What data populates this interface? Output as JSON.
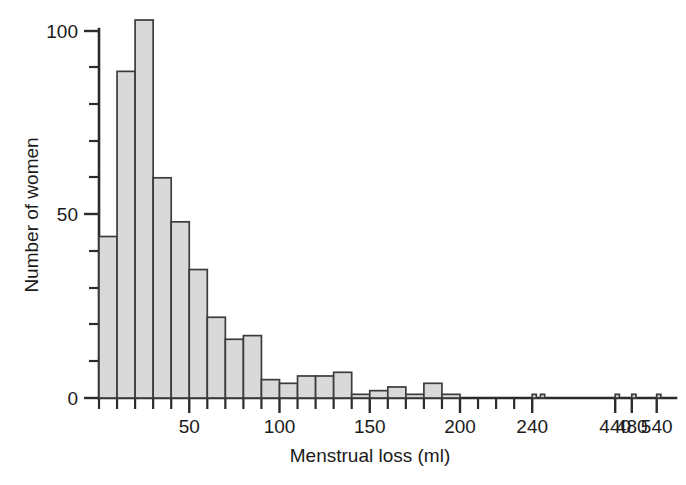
{
  "chart_data": {
    "type": "bar",
    "title": "",
    "subtitle": "",
    "xlabel": "Menstrual loss (ml)",
    "ylabel": "Number of women",
    "xlim": [
      0,
      570
    ],
    "ylim": [
      0,
      105
    ],
    "grid": false,
    "legend": null,
    "bin_width": 10,
    "axis_break_note": "x-axis compressed after 240",
    "y_ticks_major": [
      0,
      50,
      100
    ],
    "y_ticks_major_labels": [
      "0",
      "50",
      "100"
    ],
    "y_tick_minor_step": 10,
    "x_ticks_labeled": [
      50,
      100,
      150,
      200,
      240,
      440,
      480,
      540
    ],
    "x_tick_labels": [
      "50",
      "100",
      "150",
      "200",
      "240",
      "440",
      "480",
      "540"
    ],
    "x_tick_minor_step": 10,
    "bin_starts": [
      0,
      10,
      20,
      30,
      40,
      50,
      60,
      70,
      80,
      90,
      100,
      110,
      120,
      130,
      140,
      150,
      160,
      170,
      180,
      190,
      240,
      260,
      440,
      480,
      540
    ],
    "categories": [
      "0-10",
      "10-20",
      "20-30",
      "30-40",
      "40-50",
      "50-60",
      "60-70",
      "70-80",
      "80-90",
      "90-100",
      "100-110",
      "110-120",
      "120-130",
      "130-140",
      "140-150",
      "150-160",
      "160-170",
      "170-180",
      "180-190",
      "190-200",
      "240-250",
      "260-270",
      "440-450",
      "480-490",
      "540-550"
    ],
    "values": [
      44,
      89,
      103,
      60,
      48,
      35,
      22,
      16,
      17,
      5,
      4,
      6,
      6,
      7,
      1,
      2,
      3,
      1,
      4,
      1,
      1,
      1,
      1,
      1,
      1
    ],
    "colors": {
      "bar_fill": "#d9d9d9",
      "bar_stroke": "#3c3c3c",
      "axis": "#2b2b2b",
      "text": "#1a1a1a",
      "background": "#ffffff"
    }
  }
}
